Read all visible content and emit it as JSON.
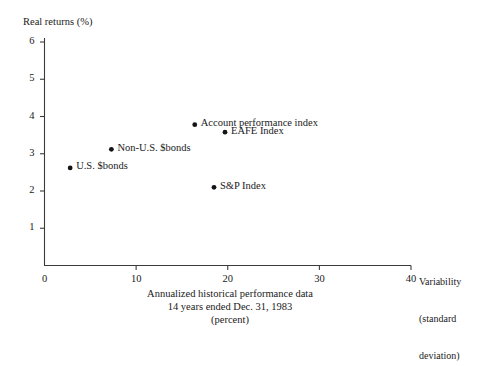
{
  "chart_data": {
    "type": "scatter",
    "title": "",
    "xlabel": "Variability (standard deviation)",
    "ylabel": "Real returns (%)",
    "xlim": [
      0,
      40
    ],
    "ylim": [
      0,
      6
    ],
    "xticks": [
      0,
      10,
      20,
      30,
      40
    ],
    "yticks": [
      1,
      2,
      3,
      4,
      5,
      6
    ],
    "xtick_labels": [
      "0",
      "10",
      "20",
      "30",
      "40"
    ],
    "ytick_labels": [
      "1",
      "2",
      "3",
      "4",
      "5",
      "6"
    ],
    "grid": false,
    "legend": "none",
    "marker": "filled-circle",
    "marker_color": "#141414",
    "points": [
      {
        "label": "Account performance index",
        "x": 16.4,
        "y": 3.78,
        "label_side": "right"
      },
      {
        "label": "EAFE Index",
        "x": 19.7,
        "y": 3.58,
        "label_side": "right"
      },
      {
        "label": "Non-U.S. $bonds",
        "x": 7.3,
        "y": 3.12,
        "label_side": "right"
      },
      {
        "label": "U.S. $bonds",
        "x": 2.8,
        "y": 2.62,
        "label_side": "right"
      },
      {
        "label": "S&P Index",
        "x": 18.5,
        "y": 2.1,
        "label_side": "right"
      }
    ],
    "caption_lines": [
      "Annualized historical performance data",
      "14 years ended Dec. 31, 1983",
      "(percent)"
    ],
    "xlabel_lines": [
      "Variability",
      "(standard",
      "deviation)"
    ]
  },
  "axes": {
    "y_title": "Real returns (%)",
    "axis_color": "#3b3b3b"
  },
  "colors": {
    "background": "#ffffff",
    "ink": "#1a1a1a",
    "axis": "#3b3b3b",
    "marker": "#141414"
  }
}
